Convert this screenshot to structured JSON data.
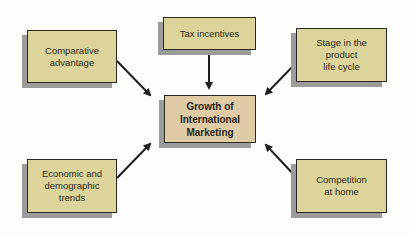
{
  "diagram": {
    "title": "Growth of International Marketing",
    "center": {
      "id": "center",
      "label": "Growth of\nInternational\nMarketing",
      "color": "#dfcca6"
    },
    "factors": [
      {
        "id": "comparative",
        "label": "Comparative\nadvantage",
        "position": "top-left"
      },
      {
        "id": "tax",
        "label": "Tax incentives",
        "position": "top"
      },
      {
        "id": "stage",
        "label": "Stage in the\nproduct\nlife cycle",
        "position": "top-right"
      },
      {
        "id": "economic",
        "label": "Economic and\ndemographic\ntrends",
        "position": "bottom-left"
      },
      {
        "id": "competition",
        "label": "Competition\nat home",
        "position": "bottom-right"
      }
    ],
    "factor_color": "#dcd49a",
    "arrow_color": "#1f1f1f",
    "edges": [
      {
        "from": "comparative",
        "to": "center"
      },
      {
        "from": "tax",
        "to": "center"
      },
      {
        "from": "stage",
        "to": "center"
      },
      {
        "from": "economic",
        "to": "center"
      },
      {
        "from": "competition",
        "to": "center"
      }
    ]
  }
}
